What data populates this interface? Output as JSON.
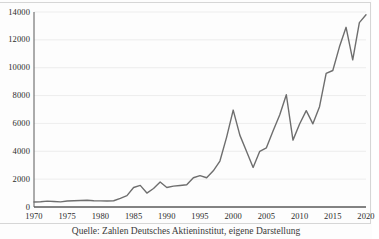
{
  "figure": {
    "caption": "Quelle: Zahlen Deutsches Aktieninstitut, eigene Darstellung",
    "background_color": "#fdfdfd",
    "frame_color": "#d6d6d6"
  },
  "chart_data": {
    "type": "line",
    "title": "",
    "subtitle": "",
    "xlabel": "",
    "ylabel": "",
    "grid": true,
    "grid_axis": "y",
    "legend": false,
    "legend_position": "none",
    "line_color": "#6e6e6e",
    "line_width": 1.4,
    "xlim": [
      1970,
      2020
    ],
    "ylim": [
      0,
      14000
    ],
    "xticks": [
      1970,
      1975,
      1980,
      1985,
      1990,
      1995,
      2000,
      2005,
      2010,
      2015,
      2020
    ],
    "xtick_labels": [
      "1970",
      "1975",
      "1980",
      "1985",
      "1990",
      "1995",
      "2000",
      "2005",
      "2010",
      "2015",
      "2020"
    ],
    "yticks": [
      0,
      2000,
      4000,
      6000,
      8000,
      10000,
      12000,
      14000
    ],
    "ytick_labels": [
      "0",
      "2000",
      "4000",
      "6000",
      "8000",
      "10000",
      "12000",
      "14000"
    ],
    "series": [
      {
        "name": "DAX",
        "x": [
          1970,
          1971,
          1972,
          1973,
          1974,
          1975,
          1976,
          1977,
          1978,
          1979,
          1980,
          1981,
          1982,
          1983,
          1984,
          1985,
          1986,
          1987,
          1988,
          1989,
          1990,
          1991,
          1992,
          1993,
          1994,
          1995,
          1996,
          1997,
          1998,
          1999,
          2000,
          2001,
          2002,
          2003,
          2004,
          2005,
          2006,
          2007,
          2008,
          2009,
          2010,
          2011,
          2012,
          2013,
          2014,
          2015,
          2016,
          2017,
          2018,
          2019
        ],
        "values": [
          360,
          380,
          420,
          400,
          370,
          430,
          450,
          470,
          480,
          450,
          440,
          430,
          450,
          620,
          820,
          1400,
          1550,
          1000,
          1330,
          1790,
          1400,
          1500,
          1545,
          1600,
          2100,
          2250,
          2100,
          2600,
          3300,
          5000,
          6960,
          5160,
          4000,
          2840,
          4000,
          4250,
          5450,
          6600,
          8060,
          4800,
          5960,
          6920,
          5970,
          7200,
          9600,
          9800,
          11500,
          12900,
          10560,
          13240
        ],
        "last_value": 13800
      }
    ],
    "annotations": []
  }
}
